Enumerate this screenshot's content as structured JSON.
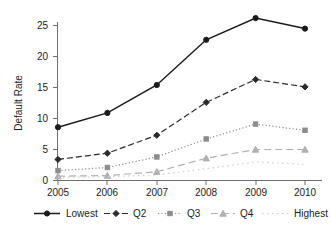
{
  "chart_data": {
    "type": "line",
    "title": "",
    "subtitle": "",
    "xlabel": "",
    "ylabel": "Default Rate",
    "x": [
      2005,
      2006,
      2007,
      2008,
      2009,
      2010
    ],
    "categories": [
      "2005",
      "2006",
      "2007",
      "2008",
      "2009",
      "2010"
    ],
    "xlim": [
      2004.75,
      2010.25
    ],
    "ylim": [
      0,
      27
    ],
    "yticks": [
      0,
      5,
      10,
      15,
      20,
      25
    ],
    "ytick_labels": [
      "0",
      "5",
      "10",
      "15",
      "20",
      "25"
    ],
    "xtick_labels": [
      "2005",
      "2006",
      "2007",
      "2008",
      "2009",
      "2010"
    ],
    "grid": false,
    "legend_position": "bottom",
    "series": [
      {
        "name": "Lowest",
        "values": [
          8.6,
          10.9,
          15.4,
          22.7,
          26.2,
          24.5
        ],
        "color": "#1a1a1a",
        "dash": "none",
        "marker": "circle"
      },
      {
        "name": "Q2",
        "values": [
          3.4,
          4.4,
          7.3,
          12.6,
          16.3,
          15.1
        ],
        "color": "#2b2b2b",
        "dash": "dashed",
        "marker": "diamond"
      },
      {
        "name": "Q3",
        "values": [
          1.6,
          2.1,
          3.8,
          6.7,
          9.1,
          8.1
        ],
        "color": "#8c8c8c",
        "dash": "dotted",
        "marker": "square"
      },
      {
        "name": "Q4",
        "values": [
          0.7,
          0.8,
          1.4,
          3.6,
          5.0,
          5.0
        ],
        "color": "#b0b0b0",
        "dash": "longdash",
        "marker": "triangle"
      },
      {
        "name": "Highest",
        "values": [
          0.5,
          0.6,
          0.9,
          1.9,
          3.0,
          2.6
        ],
        "color": "#cccccc",
        "dash": "sparsedot",
        "marker": "none"
      }
    ]
  },
  "axes": {
    "y_title": "Default Rate",
    "y_ticks": [
      "25",
      "20",
      "15",
      "10",
      "5",
      "0"
    ],
    "x_ticks": [
      "2005",
      "2006",
      "2007",
      "2008",
      "2009",
      "2010"
    ]
  },
  "legend": {
    "items": [
      {
        "label": "Lowest"
      },
      {
        "label": "Q2"
      },
      {
        "label": "Q3"
      },
      {
        "label": "Q4"
      },
      {
        "label": "Highest"
      }
    ]
  },
  "colors": {
    "axis": "#6e6e6e",
    "text": "#1c1c1c",
    "background": "#ffffff"
  }
}
